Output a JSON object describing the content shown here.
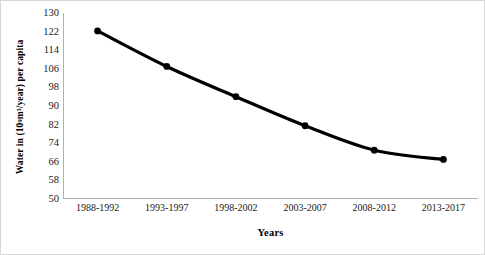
{
  "chart_data": {
    "type": "line",
    "title": "",
    "xlabel": "Years",
    "ylabel_plain": "Water in (10^9 m3/year) per capita",
    "ylabel_parts": {
      "before": "Water in (10",
      "exponent": "9",
      "after": " m³/year) per capita"
    },
    "categories": [
      "1988-1992",
      "1993-1997",
      "1998-2002",
      "2003-2007",
      "2008-2012",
      "2013-2017"
    ],
    "values": [
      122.3,
      107.0,
      94.0,
      81.5,
      71.0,
      67.0
    ],
    "series": [
      {
        "name": "Water per capita",
        "values": [
          122.3,
          107.0,
          94.0,
          81.5,
          71.0,
          67.0
        ]
      }
    ],
    "ylim": [
      50,
      130
    ],
    "yticks": [
      130,
      122,
      114,
      106,
      98,
      90,
      82,
      74,
      66,
      58,
      50
    ],
    "ytick_step": 8,
    "xlim_categories": 6,
    "grid": false,
    "legend": "none",
    "line_color": "#000000",
    "marker_color": "#000000",
    "marker_shape": "circle",
    "line_width_px": 3.2,
    "marker_radius_px": 3.4,
    "background_color": "#ffffff",
    "axis_color": "#b0b0b0"
  }
}
